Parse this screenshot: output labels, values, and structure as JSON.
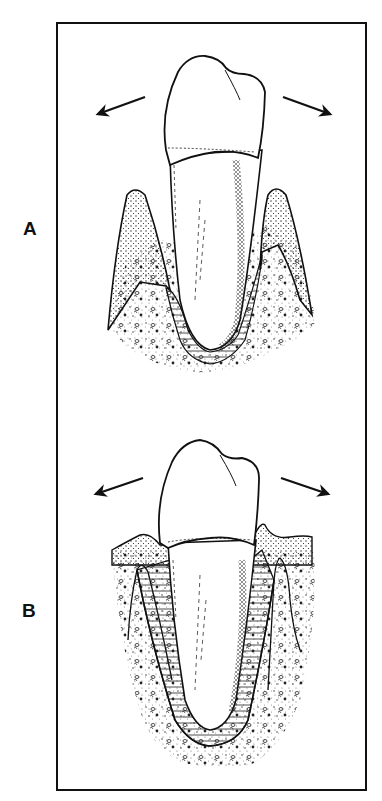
{
  "figure": {
    "panels": [
      {
        "label": "A",
        "description": "Tooth with narrow gingiva/bone crests; periodontal ligament widened only near the alveolar crest (funnel-shaped); arrows show lateral (jiggling) forces",
        "arrows": [
          "force-left-arrow",
          "force-right-arrow"
        ]
      },
      {
        "label": "B",
        "description": "Tooth with periodontal ligament space widened along the entire root; gingiva above bone crests; arrows show lateral (jiggling) forces",
        "arrows": [
          "force-left-arrow",
          "force-right-arrow"
        ]
      }
    ],
    "colors": {
      "ink": "#111111",
      "background": "#ffffff",
      "frame": "#111111"
    }
  }
}
